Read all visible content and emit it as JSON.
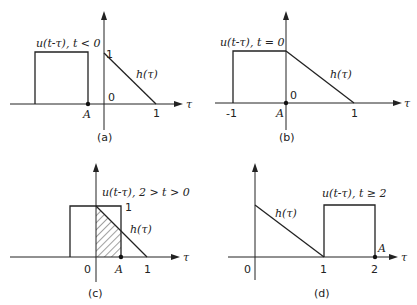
{
  "figure": {
    "panels": [
      {
        "id": "a",
        "caption": "(a)",
        "u_label": "u(t-τ), t < 0",
        "h_label": "h(τ)",
        "axis_label": "τ",
        "ticks": {
          "one_y": "1",
          "origin": "0",
          "one_x": "1",
          "A": "A"
        }
      },
      {
        "id": "b",
        "caption": "(b)",
        "u_label": "u(t-τ), t = 0",
        "h_label": "h(τ)",
        "axis_label": "τ",
        "ticks": {
          "neg_one": "-1",
          "origin": "0",
          "one_x": "1",
          "A": "A"
        }
      },
      {
        "id": "c",
        "caption": "(c)",
        "u_label": "u(t-τ), 2 > t > 0",
        "h_label": "h(τ)",
        "axis_label": "τ",
        "ticks": {
          "one_y": "1",
          "origin": "0",
          "one_x": "1",
          "A": "A"
        }
      },
      {
        "id": "d",
        "caption": "(d)",
        "u_label": "u(t-τ), t ≥ 2",
        "h_label": "h(τ)",
        "axis_label": "τ",
        "ticks": {
          "origin": "0",
          "one_x": "1",
          "two_x": "2",
          "A": "A"
        }
      }
    ]
  }
}
